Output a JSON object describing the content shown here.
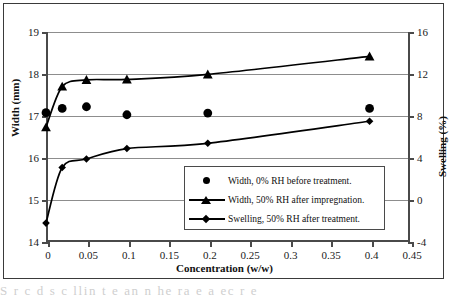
{
  "chart_data": {
    "type": "scatter",
    "title": "",
    "xlabel": "Concentration (w/w)",
    "ylabel": "Width (mm)",
    "y2label": "Swelling (%)",
    "xlim": [
      0,
      0.45
    ],
    "ylim": [
      14,
      19
    ],
    "y2lim": [
      -4,
      16
    ],
    "grid": true,
    "legend_position": "inside-bottom-right",
    "x_ticks": [
      "0",
      "0.05",
      "0.1",
      "0.15",
      "0.2",
      "0.25",
      "0.3",
      "0.35",
      "0.4",
      "0.45"
    ],
    "x_tick_values": [
      0,
      0.05,
      0.1,
      0.15,
      0.2,
      0.25,
      0.3,
      0.35,
      0.4,
      0.45
    ],
    "y_ticks": [
      "14",
      "15",
      "16",
      "17",
      "18",
      "19"
    ],
    "y_tick_values": [
      14,
      15,
      16,
      17,
      18,
      19
    ],
    "y2_ticks": [
      "-4",
      "0",
      "4",
      "8",
      "12",
      "16"
    ],
    "y2_tick_values": [
      -4,
      0,
      4,
      8,
      12,
      16
    ],
    "x": [
      0,
      0.02,
      0.05,
      0.1,
      0.2,
      0.4
    ],
    "series": [
      {
        "name": "Width, 0% RH before treatment.",
        "marker": "circle",
        "axis": "left",
        "line": false,
        "values": [
          17.08,
          17.18,
          17.22,
          17.03,
          17.07,
          17.18
        ]
      },
      {
        "name": "Width, 50% RH after impregnation.",
        "marker": "triangle",
        "axis": "left",
        "line": true,
        "values": [
          16.73,
          17.7,
          17.86,
          17.87,
          17.99,
          18.42
        ]
      },
      {
        "name": "Swelling,  50% RH after treatment.",
        "marker": "diamond",
        "axis": "right",
        "line": true,
        "values": [
          -2.2,
          3.1,
          3.9,
          4.9,
          5.4,
          7.5
        ]
      }
    ]
  },
  "axes": {
    "x_title": "Concentration (w/w)",
    "y_left_title": "Width (mm)",
    "y_right_title": "Swelling (%)"
  },
  "legend": {
    "entries": [
      {
        "label": "Width, 0% RH before treatment.",
        "marker": "circle-marker",
        "has_line": false
      },
      {
        "label": "Width, 50% RH after impregnation.",
        "marker": "triangle-marker",
        "has_line": true
      },
      {
        "label": "Swelling,  50% RH after treatment.",
        "marker": "diamond-marker",
        "has_line": true
      }
    ]
  },
  "page": {
    "caption_fragment": "S  r    c  d  s  c  llin   t  e  an    n  he  ra   e    a   ec  r    e"
  },
  "colors": {
    "ink": "#000000",
    "grid": "#8d8d8d",
    "axis": "#4a4a4a",
    "background": "#ffffff"
  }
}
